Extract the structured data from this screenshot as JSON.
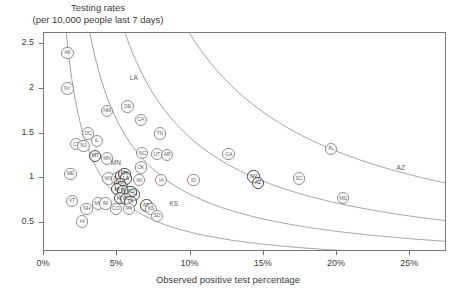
{
  "chart_data": {
    "type": "scatter",
    "title": "Testing rates",
    "subtitle": "(per 10,000 people last 7 days)",
    "xlabel": "Observed positive test percentage",
    "ylabel": "Testing rates (per 10,000 people last 7 days)",
    "xlim": [
      0,
      27.5
    ],
    "ylim": [
      0.18,
      2.62
    ],
    "grid": false,
    "legend": null,
    "xticks": [
      "0%",
      "5%",
      "10%",
      "15%",
      "20%",
      "25%"
    ],
    "xtick_values": [
      0,
      5,
      10,
      15,
      20,
      25
    ],
    "yticks": [
      "0.5",
      "1",
      "1.5",
      "2",
      "2.5"
    ],
    "ytick_values": [
      0.5,
      1,
      1.5,
      2,
      2.5
    ],
    "point_label_key": "US state / territory postal abbreviation",
    "points": [
      {
        "label": "AK",
        "x": 1.6,
        "y": 2.4
      },
      {
        "label": "NY",
        "x": 1.6,
        "y": 2.0
      },
      {
        "label": "NM",
        "x": 4.3,
        "y": 1.75
      },
      {
        "label": "DE",
        "x": 5.7,
        "y": 1.8
      },
      {
        "label": "CA",
        "x": 6.6,
        "y": 1.65
      },
      {
        "label": "TN",
        "x": 7.9,
        "y": 1.5
      },
      {
        "label": "DC",
        "x": 3.0,
        "y": 1.5
      },
      {
        "label": "IL",
        "x": 3.6,
        "y": 1.42
      },
      {
        "label": "CT",
        "x": 2.2,
        "y": 1.38
      },
      {
        "label": "NJ",
        "x": 2.7,
        "y": 1.36
      },
      {
        "label": "MN",
        "x": 4.3,
        "y": 1.22
      },
      {
        "label": "MT",
        "x": 3.5,
        "y": 1.25
      },
      {
        "label": "NC",
        "x": 6.7,
        "y": 1.28
      },
      {
        "label": "UT",
        "x": 7.7,
        "y": 1.27
      },
      {
        "label": "AR",
        "x": 8.4,
        "y": 1.26
      },
      {
        "label": "GA",
        "x": 12.6,
        "y": 1.27
      },
      {
        "label": "FL",
        "x": 19.6,
        "y": 1.33
      },
      {
        "label": "ME",
        "x": 1.8,
        "y": 1.05
      },
      {
        "label": "WV",
        "x": 4.4,
        "y": 1.0
      },
      {
        "label": "ND",
        "x": 5.0,
        "y": 1.0
      },
      {
        "label": "OK",
        "x": 6.6,
        "y": 1.12
      },
      {
        "label": "WI",
        "x": 6.5,
        "y": 0.98
      },
      {
        "label": "IA",
        "x": 8.0,
        "y": 0.98
      },
      {
        "label": "ID",
        "x": 10.2,
        "y": 0.98
      },
      {
        "label": "NV",
        "x": 14.3,
        "y": 1.02
      },
      {
        "label": "AZ",
        "x": 14.6,
        "y": 0.95
      },
      {
        "label": "SC",
        "x": 17.4,
        "y": 1.0
      },
      {
        "label": "MS",
        "x": 20.4,
        "y": 0.78
      },
      {
        "label": "VA",
        "x": 5.3,
        "y": 1.03
      },
      {
        "label": "MD",
        "x": 5.5,
        "y": 1.05
      },
      {
        "label": "LA",
        "x": 5.6,
        "y": 1.0
      },
      {
        "label": "WA",
        "x": 5.2,
        "y": 0.94
      },
      {
        "label": "OR",
        "x": 5.3,
        "y": 0.9
      },
      {
        "label": "NH",
        "x": 2.9,
        "y": 0.66
      },
      {
        "label": "VT",
        "x": 1.9,
        "y": 0.75
      },
      {
        "label": "MA",
        "x": 3.7,
        "y": 0.72
      },
      {
        "label": "RI",
        "x": 4.2,
        "y": 0.72
      },
      {
        "label": "HI",
        "x": 2.6,
        "y": 0.52
      },
      {
        "label": "MI",
        "x": 5.0,
        "y": 0.88
      },
      {
        "label": "IN",
        "x": 5.4,
        "y": 0.86
      },
      {
        "label": "OH",
        "x": 6.1,
        "y": 0.82
      },
      {
        "label": "MO",
        "x": 5.9,
        "y": 0.85
      },
      {
        "label": "KY",
        "x": 5.2,
        "y": 0.78
      },
      {
        "label": "AL",
        "x": 5.6,
        "y": 0.77
      },
      {
        "label": "TX",
        "x": 5.9,
        "y": 0.74
      },
      {
        "label": "CO",
        "x": 4.9,
        "y": 0.66
      },
      {
        "label": "PA",
        "x": 5.8,
        "y": 0.66
      },
      {
        "label": "NE",
        "x": 7.0,
        "y": 0.7
      },
      {
        "label": "KS",
        "x": 7.3,
        "y": 0.66
      },
      {
        "label": "SD",
        "x": 7.7,
        "y": 0.58
      }
    ],
    "iso_curves": [
      {
        "label": "",
        "constant": 0.04
      },
      {
        "label": "",
        "constant": 0.082
      },
      {
        "label": "LA",
        "constant": 0.145
      },
      {
        "label": "AZ",
        "constant": 0.26
      }
    ],
    "curve_labels": [
      {
        "text": "LA",
        "x": 6.2,
        "y": 2.12
      },
      {
        "text": "AZ",
        "x": 24.4,
        "y": 1.12
      },
      {
        "text": "MN",
        "x": 4.9,
        "y": 1.17
      },
      {
        "text": "KS",
        "x": 8.9,
        "y": 0.71
      }
    ]
  }
}
